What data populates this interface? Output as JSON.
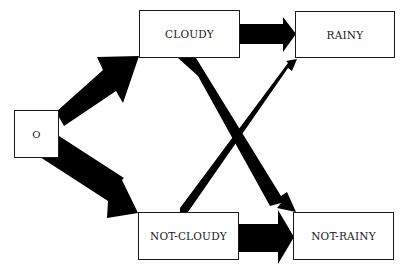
{
  "diagram": {
    "type": "state-transition",
    "nodes": [
      {
        "id": "o",
        "label": "O"
      },
      {
        "id": "cloudy",
        "label": "CLOUDY"
      },
      {
        "id": "rainy",
        "label": "RAINY"
      },
      {
        "id": "not_cloudy",
        "label": "NOT-CLOUDY"
      },
      {
        "id": "not_rainy",
        "label": "NOT-RAINY"
      }
    ],
    "edges": [
      {
        "from": "o",
        "to": "cloudy",
        "weight": "medium"
      },
      {
        "from": "o",
        "to": "not_cloudy",
        "weight": "heavy"
      },
      {
        "from": "cloudy",
        "to": "rainy",
        "weight": "medium"
      },
      {
        "from": "cloudy",
        "to": "not_rainy",
        "weight": "medium"
      },
      {
        "from": "not_cloudy",
        "to": "rainy",
        "weight": "light"
      },
      {
        "from": "not_cloudy",
        "to": "not_rainy",
        "weight": "heavy"
      }
    ],
    "colors": {
      "arrow": "#000000",
      "box_border": "#1a1a1a",
      "background": "#ffffff"
    }
  }
}
